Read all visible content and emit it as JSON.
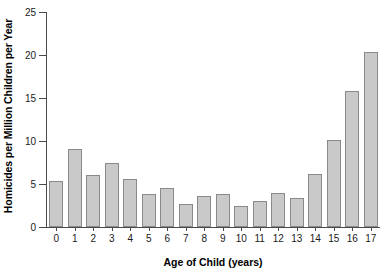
{
  "chart_data": {
    "type": "bar",
    "title": "",
    "xlabel": "Age of Child (years)",
    "ylabel": "Homicides per Million Children per Year",
    "categories": [
      "0",
      "1",
      "2",
      "3",
      "4",
      "5",
      "6",
      "7",
      "8",
      "9",
      "10",
      "11",
      "12",
      "13",
      "14",
      "15",
      "16",
      "17"
    ],
    "values": [
      5.3,
      9.1,
      6.1,
      7.4,
      5.6,
      3.8,
      4.5,
      2.7,
      3.6,
      3.8,
      2.4,
      3.0,
      3.9,
      3.4,
      6.2,
      10.1,
      15.8,
      20.4
    ],
    "ylim": [
      0,
      25
    ],
    "yticks": [
      0,
      5,
      10,
      15,
      20,
      25
    ],
    "ytick_labels": [
      "0",
      "5",
      "10",
      "15",
      "20",
      "25"
    ],
    "grid": false,
    "legend": false,
    "bar_fill_color": "#c9c9c9",
    "bar_edge_color": "#8a8a8a",
    "axis_color": "#4a4a4a"
  }
}
